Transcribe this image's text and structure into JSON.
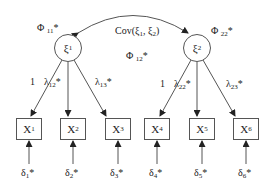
{
  "diagram": {
    "type": "confirmatory-factor-analysis-path-diagram",
    "latent_factors": [
      {
        "id": "xi1",
        "symbol": "ξ",
        "index": "1",
        "variance_label": "Φ",
        "variance_index": "11",
        "variance_suffix": "*"
      },
      {
        "id": "xi2",
        "symbol": "ξ",
        "index": "2",
        "variance_label": "Φ",
        "variance_index": "22",
        "variance_suffix": "*"
      }
    ],
    "covariance": {
      "label": "Cov(ξ",
      "label_full": "Cov(ξ1, ξ2)",
      "sub1": "1",
      "sep": ", ξ",
      "sub2": "2",
      "close": ")",
      "phi_label": "Φ",
      "phi_index": "12",
      "phi_suffix": "*"
    },
    "indicators": [
      {
        "symbol": "X",
        "index": "1",
        "factor": "xi1",
        "loading": "1",
        "loading_index": "",
        "error_symbol": "δ",
        "error_index": "1",
        "error_suffix": "*"
      },
      {
        "symbol": "X",
        "index": "2",
        "factor": "xi1",
        "loading": "λ",
        "loading_index": "12",
        "loading_suffix": "*",
        "error_symbol": "δ",
        "error_index": "2",
        "error_suffix": "*"
      },
      {
        "symbol": "X",
        "index": "3",
        "factor": "xi1",
        "loading": "λ",
        "loading_index": "13",
        "loading_suffix": "*",
        "error_symbol": "δ",
        "error_index": "3",
        "error_suffix": "*"
      },
      {
        "symbol": "X",
        "index": "4",
        "factor": "xi2",
        "loading": "1",
        "loading_index": "",
        "error_symbol": "δ",
        "error_index": "4",
        "error_suffix": "*"
      },
      {
        "symbol": "X",
        "index": "5",
        "factor": "xi2",
        "loading": "λ",
        "loading_index": "22",
        "loading_suffix": "*",
        "error_symbol": "δ",
        "error_index": "5",
        "error_suffix": "*"
      },
      {
        "symbol": "X",
        "index": "6",
        "factor": "xi2",
        "loading": "λ",
        "loading_index": "23",
        "loading_suffix": "*",
        "error_symbol": "δ",
        "error_index": "6",
        "error_suffix": "*"
      }
    ],
    "colors": {
      "stroke": "#555555",
      "text": "#222222",
      "background": "#ffffff"
    }
  }
}
